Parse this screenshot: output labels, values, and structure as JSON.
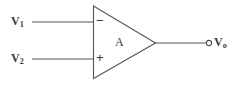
{
  "diagram": {
    "kind": "operational-amplifier-schematic",
    "canvas": {
      "width": 238,
      "height": 86,
      "background": "#ffffff"
    },
    "stroke_color": "#555555",
    "text_color": "#3a3a3a",
    "amplifier": {
      "body_label": "A",
      "inverting_sign": "−",
      "non_inverting_sign": "+",
      "triangle": {
        "left_x": 93,
        "top_y": 6,
        "bottom_y": 78,
        "apex_x": 155,
        "apex_y": 43
      }
    },
    "inputs": [
      {
        "name": "inverting-input",
        "label_main": "V",
        "label_sub": "1",
        "polarity": "−",
        "wire": {
          "x1": 32,
          "y1": 22,
          "x2": 93,
          "y2": 22
        }
      },
      {
        "name": "non-inverting-input",
        "label_main": "V",
        "label_sub": "2",
        "polarity": "+",
        "wire": {
          "x1": 32,
          "y1": 59,
          "x2": 93,
          "y2": 59
        }
      }
    ],
    "output": {
      "name": "output-terminal",
      "label_main": "V",
      "label_sub": "o",
      "wire": {
        "x1": 155,
        "y1": 43,
        "x2": 207,
        "y2": 43
      },
      "node": {
        "cx": 209,
        "cy": 43,
        "r": 2.6
      }
    }
  }
}
